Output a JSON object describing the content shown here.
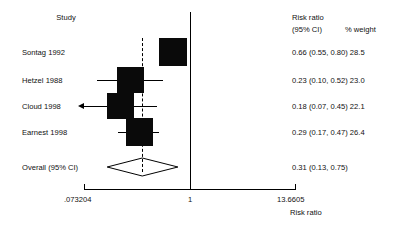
{
  "chart_data": {
    "type": "forest",
    "title": "",
    "xlabel": "Risk ratio",
    "ylabel": "",
    "xscale": "log",
    "xlim": [
      0.073204,
      13.6605
    ],
    "xticks": [
      0.073204,
      1,
      13.6605
    ],
    "xticklabels": [
      ".073204",
      "1",
      "13.6605"
    ],
    "reference_line": 1,
    "pooled_line": 0.31,
    "grid": false,
    "columns": {
      "study": "Study",
      "effect_line1": "Risk ratio",
      "effect_line2": "(95% CI)",
      "weight": "% weight"
    },
    "studies": [
      {
        "label": "Sontag 1992",
        "estimate": 0.66,
        "ci_low": 0.55,
        "ci_high": 0.8,
        "weight": 28.5,
        "stat_text": "0.66 (0.55, 0.80) 28.5",
        "ci_truncated_left": false
      },
      {
        "label": "Hetzel 1988",
        "estimate": 0.23,
        "ci_low": 0.1,
        "ci_high": 0.52,
        "weight": 23.0,
        "stat_text": "0.23 (0.10, 0.52) 23.0",
        "ci_truncated_left": false
      },
      {
        "label": "Cloud 1998",
        "estimate": 0.18,
        "ci_low": 0.07,
        "ci_high": 0.45,
        "weight": 22.1,
        "stat_text": "0.18 (0.07, 0.45) 22.1",
        "ci_truncated_left": true
      },
      {
        "label": "Earnest 1998",
        "estimate": 0.29,
        "ci_low": 0.17,
        "ci_high": 0.47,
        "weight": 26.4,
        "stat_text": "0.29 (0.17, 0.47) 26.4",
        "ci_truncated_left": false
      }
    ],
    "overall": {
      "label": "Overall (95% CI)",
      "estimate": 0.31,
      "ci_low": 0.13,
      "ci_high": 0.75,
      "stat_text": "0.31 (0.13, 0.75)"
    },
    "colors": {
      "marker": "#0a0a0a",
      "line": "#000000",
      "text": "#111111",
      "background": "#ffffff"
    }
  }
}
